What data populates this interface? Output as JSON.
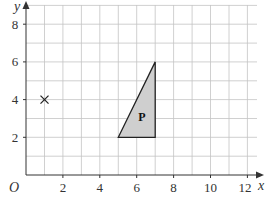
{
  "diagram": {
    "type": "coordinate-grid",
    "axes": {
      "x_label": "x",
      "y_label": "y",
      "origin_label": "O",
      "x_ticks": [
        "2",
        "4",
        "6",
        "8",
        "10",
        "12"
      ],
      "y_ticks": [
        "2",
        "4",
        "6",
        "8"
      ],
      "x_range": [
        0,
        12.5
      ],
      "y_range": [
        0,
        9
      ]
    },
    "shape": {
      "label": "P",
      "type": "triangle",
      "vertices": [
        [
          5,
          2
        ],
        [
          7,
          2
        ],
        [
          7,
          6
        ]
      ],
      "fill": "#cfcfcf",
      "stroke": "#222222"
    },
    "marker": {
      "symbol": "×",
      "position": [
        1,
        4
      ]
    },
    "colors": {
      "grid": "#bdbdbd",
      "axis": "#333333"
    }
  }
}
